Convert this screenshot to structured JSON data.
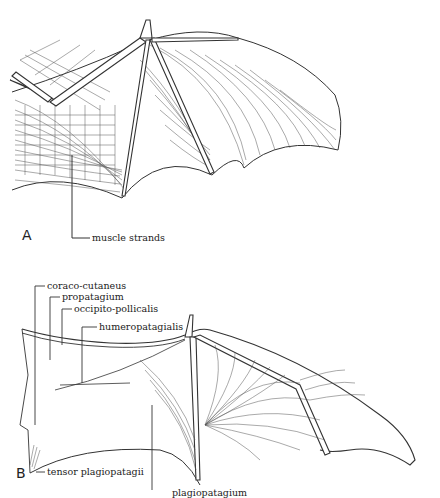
{
  "figure": {
    "panels": [
      {
        "letter": "A",
        "labels": [
          {
            "id": "muscle-strands",
            "text": "muscle strands"
          }
        ]
      },
      {
        "letter": "B",
        "labels": [
          {
            "id": "coraco-cutaneus",
            "text": "coraco-cutaneus"
          },
          {
            "id": "propatagium",
            "text": "propatagium"
          },
          {
            "id": "occipito-pollicalis",
            "text": "occipito-pollicalis"
          },
          {
            "id": "humeropatagialis",
            "text": "humeropatagialis"
          },
          {
            "id": "tensor-plagiopatagii",
            "text": "tensor plagiopatagii"
          },
          {
            "id": "plagiopatagium",
            "text": "plagiopatagium"
          }
        ]
      }
    ],
    "colors": {
      "ink": "#222222",
      "background": "#ffffff"
    }
  }
}
